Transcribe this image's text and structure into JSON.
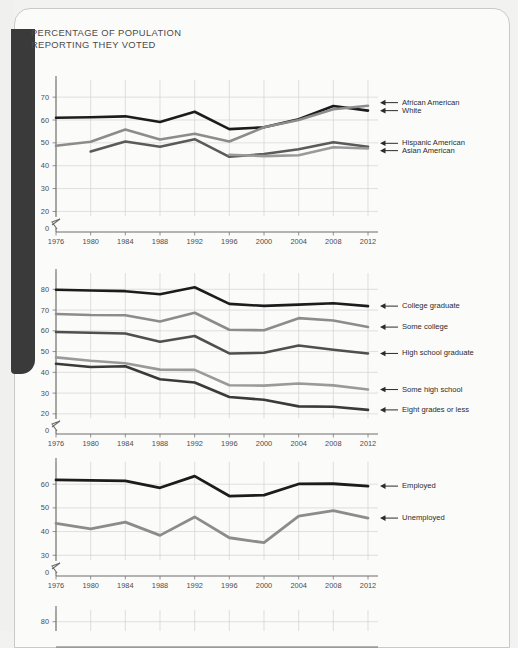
{
  "page": {
    "title": "PERCENTAGE OF POPULATION\nREPORTING THEY VOTED",
    "background_color": "#fbfbfa",
    "binding_color": "#3a3a3a"
  },
  "chart_data": [
    {
      "id": "chart-race",
      "type": "line",
      "title": "PERCENTAGE OF POPULATION REPORTING THEY VOTED",
      "xlabel": "",
      "ylabel": "",
      "x": [
        1976,
        1980,
        1984,
        1988,
        1992,
        1996,
        2000,
        2004,
        2008,
        2012
      ],
      "xtick_labels": [
        "1976",
        "1980",
        "1984",
        "1988",
        "1992",
        "1996",
        "2000",
        "2004",
        "2008",
        "2012"
      ],
      "ytick_labels": [
        "0",
        "20",
        "30",
        "40",
        "50",
        "60",
        "70"
      ],
      "ytick_values": [
        0,
        20,
        30,
        40,
        50,
        60,
        70
      ],
      "ylim": [
        18,
        74
      ],
      "axis_break": true,
      "grid": true,
      "legend_position": "right",
      "series": [
        {
          "name": "White",
          "color": "#1c1c1c",
          "width": 2.6,
          "values": [
            61,
            61.2,
            61.6,
            59.1,
            63.6,
            56.0,
            56.8,
            60.3,
            66.1,
            64.1
          ],
          "label_y": 64.1
        },
        {
          "name": "African American",
          "color": "#8c8c8c",
          "width": 2.6,
          "values": [
            48.7,
            50.5,
            55.8,
            51.5,
            54.0,
            50.6,
            56.8,
            60.0,
            64.7,
            66.2
          ],
          "label_y": 67.6
        },
        {
          "name": "Hispanic American",
          "color": "#5b5b5b",
          "width": 2.6,
          "values": [
            null,
            46.2,
            50.6,
            48.3,
            51.6,
            43.9,
            45.1,
            47.2,
            50.3,
            48.3
          ],
          "label_y": 49.8
        },
        {
          "name": "Asian American",
          "color": "#9a9a9a",
          "width": 2.6,
          "values": [
            null,
            null,
            null,
            null,
            null,
            44.8,
            44.2,
            44.6,
            48.1,
            47.5
          ],
          "label_y": 46.6
        }
      ],
      "legend_entries": [
        {
          "name": "African American",
          "y_value": 67.6
        },
        {
          "name": "White",
          "y_value": 64.1
        },
        {
          "name": "Hispanic American",
          "y_value": 49.8
        },
        {
          "name": "Asian American",
          "y_value": 46.6
        }
      ]
    },
    {
      "id": "chart-education",
      "type": "line",
      "title": "",
      "xlabel": "",
      "ylabel": "",
      "x": [
        1976,
        1980,
        1984,
        1988,
        1992,
        1996,
        2000,
        2004,
        2008,
        2012
      ],
      "xtick_labels": [
        "1976",
        "1980",
        "1984",
        "1988",
        "1992",
        "1996",
        "2000",
        "2004",
        "2008",
        "2012"
      ],
      "ytick_labels": [
        "0",
        "20",
        "30",
        "40",
        "50",
        "60",
        "70",
        "80"
      ],
      "ytick_values": [
        0,
        20,
        30,
        40,
        50,
        60,
        70,
        80
      ],
      "ylim": [
        18,
        84
      ],
      "axis_break": true,
      "grid": true,
      "legend_position": "right",
      "series": [
        {
          "name": "College graduate",
          "color": "#1c1c1c",
          "width": 2.6,
          "values": [
            79.8,
            79.4,
            79.1,
            77.6,
            81.0,
            73.0,
            72.0,
            72.6,
            73.3,
            71.9
          ],
          "label_y": 71.9
        },
        {
          "name": "Some college",
          "color": "#8c8c8c",
          "width": 2.6,
          "values": [
            68.1,
            67.6,
            67.5,
            64.5,
            68.7,
            60.5,
            60.3,
            66.1,
            65.0,
            61.8
          ],
          "label_y": 61.8
        },
        {
          "name": "High school graduate",
          "color": "#4f4f4f",
          "width": 2.6,
          "values": [
            59.4,
            59.1,
            58.7,
            54.7,
            57.5,
            49.1,
            49.4,
            52.9,
            50.9,
            49.1
          ],
          "label_y": 49.1
        },
        {
          "name": "Some high school",
          "color": "#9a9a9a",
          "width": 2.6,
          "values": [
            47.2,
            45.6,
            44.4,
            41.3,
            41.2,
            33.8,
            33.6,
            34.6,
            33.7,
            31.7
          ],
          "label_y": 31.7
        },
        {
          "name": "Eight grades or less",
          "color": "#3a3a3a",
          "width": 2.6,
          "values": [
            44.1,
            42.6,
            42.9,
            36.7,
            35.1,
            28.1,
            26.8,
            23.6,
            23.4,
            21.9
          ],
          "label_y": 21.9
        }
      ],
      "legend_entries": [
        {
          "name": "College graduate",
          "y_value": 71.9
        },
        {
          "name": "Some college",
          "y_value": 61.8
        },
        {
          "name": "High school graduate",
          "y_value": 49.1
        },
        {
          "name": "Some high school",
          "y_value": 31.7
        },
        {
          "name": "Eight grades or less",
          "y_value": 21.9
        }
      ]
    },
    {
      "id": "chart-employment",
      "type": "line",
      "title": "",
      "xlabel": "",
      "ylabel": "",
      "x": [
        1976,
        1980,
        1984,
        1988,
        1992,
        1996,
        2000,
        2004,
        2008,
        2012
      ],
      "xtick_labels": [
        "1976",
        "1980",
        "1984",
        "1988",
        "1992",
        "1996",
        "2000",
        "2004",
        "2008",
        "2012"
      ],
      "ytick_labels": [
        "0",
        "30",
        "40",
        "50",
        "60"
      ],
      "ytick_values": [
        0,
        30,
        40,
        50,
        60
      ],
      "ylim": [
        28,
        66
      ],
      "axis_break": true,
      "grid": true,
      "legend_position": "right",
      "series": [
        {
          "name": "Employed",
          "color": "#1c1c1c",
          "width": 2.8,
          "values": [
            61.8,
            61.6,
            61.4,
            58.5,
            63.4,
            55.0,
            55.4,
            60.1,
            60.2,
            59.2
          ],
          "label_y": 59.2
        },
        {
          "name": "Unemployed",
          "color": "#8c8c8c",
          "width": 2.8,
          "values": [
            43.5,
            41.1,
            44.0,
            38.4,
            46.2,
            37.4,
            35.3,
            46.5,
            48.8,
            45.7
          ],
          "label_y": 45.7
        }
      ],
      "legend_entries": [
        {
          "name": "Employed",
          "y_value": 59.2
        },
        {
          "name": "Unemployed",
          "y_value": 45.7
        }
      ]
    },
    {
      "id": "chart-partial",
      "type": "line",
      "title": "",
      "xlabel": "",
      "ylabel": "",
      "x": [
        1976,
        1980,
        1984,
        1988,
        1992,
        1996,
        2000,
        2004,
        2008,
        2012
      ],
      "xtick_labels": [],
      "ytick_labels": [
        "80"
      ],
      "ytick_values": [
        80
      ],
      "ylim": [
        70,
        84
      ],
      "axis_break": false,
      "grid": true,
      "legend_position": "none",
      "series": [],
      "legend_entries": []
    }
  ]
}
